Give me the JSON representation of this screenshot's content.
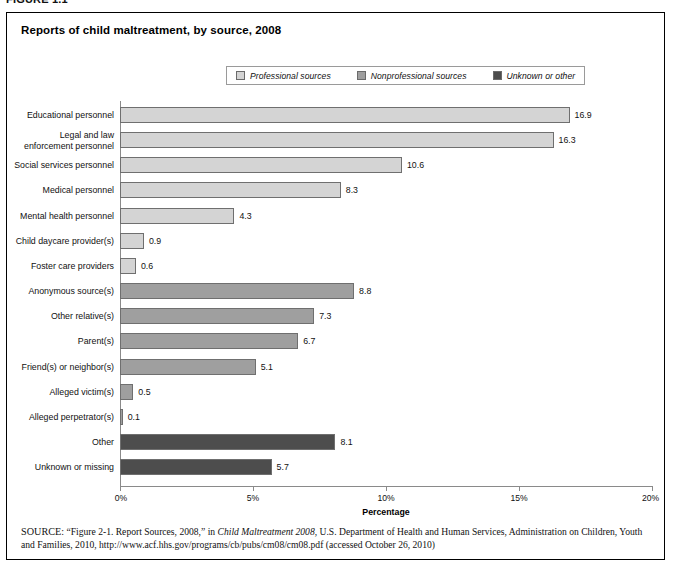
{
  "figure_number": "FIGURE 1.1",
  "chart_title": "Reports of child maltreatment, by source, 2008",
  "legend": {
    "items": [
      {
        "label": "Professional sources",
        "color": "#d4d4d4",
        "key": "professional"
      },
      {
        "label": "Nonprofessional sources",
        "color": "#9f9f9f",
        "key": "nonprofessional"
      },
      {
        "label": "Unknown or other",
        "color": "#4d4d4d",
        "key": "unknown"
      }
    ]
  },
  "x_axis": {
    "title": "Percentage",
    "ticks": [
      "0%",
      "5%",
      "10%",
      "15%",
      "20%"
    ],
    "tick_values": [
      0,
      5,
      10,
      15,
      20
    ],
    "min": 0,
    "max": 20
  },
  "source_note": {
    "prefix": "SOURCE:",
    "part1": " “Figure 2-1. Report Sources, 2008,” in ",
    "italic1": "Child Maltreatment 2008",
    "part2": ", U.S. Department of Health and Human Services, Administration on Children, Youth and Families, 2010, http://www.acf.hhs.gov/programs/cb/pubs/cm08/cm08.pdf (accessed October 26, 2010)"
  },
  "chart_data": {
    "type": "bar",
    "orientation": "horizontal",
    "title": "Reports of child maltreatment, by source, 2008",
    "xlabel": "Percentage",
    "ylabel": "",
    "xlim": [
      0,
      20
    ],
    "grid": false,
    "legend_position": "top-center",
    "categories": [
      "Educational personnel",
      "Legal and law\nenforcement personnel",
      "Social services personnel",
      "Medical personnel",
      "Mental health personnel",
      "Child daycare provider(s)",
      "Foster care providers",
      "Anonymous source(s)",
      "Other relative(s)",
      "Parent(s)",
      "Friend(s) or neighbor(s)",
      "Alleged victim(s)",
      "Alleged perpetrator(s)",
      "Other",
      "Unknown or missing"
    ],
    "values": [
      16.9,
      16.3,
      10.6,
      8.3,
      4.3,
      0.9,
      0.6,
      8.8,
      7.3,
      6.7,
      5.1,
      0.5,
      0.1,
      8.1,
      5.7
    ],
    "value_labels": [
      "16.9",
      "16.3",
      "10.6",
      "8.3",
      "4.3",
      "0.9",
      "0.6",
      "8.8",
      "7.3",
      "6.7",
      "5.1",
      "0.5",
      "0.1",
      "8.1",
      "5.7"
    ],
    "group_of": [
      "professional",
      "professional",
      "professional",
      "professional",
      "professional",
      "professional",
      "professional",
      "nonprofessional",
      "nonprofessional",
      "nonprofessional",
      "nonprofessional",
      "nonprofessional",
      "nonprofessional",
      "unknown",
      "unknown"
    ],
    "series": [
      {
        "name": "Professional sources",
        "color": "#d4d4d4"
      },
      {
        "name": "Nonprofessional sources",
        "color": "#9f9f9f"
      },
      {
        "name": "Unknown or other",
        "color": "#4d4d4d"
      }
    ]
  }
}
